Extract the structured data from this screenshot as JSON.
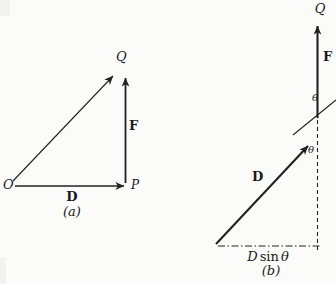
{
  "figure": {
    "ink_color": "#222222",
    "background_color": "#fbfbfa",
    "panel_a": {
      "caption": "(a)",
      "point_O": "O",
      "point_P": "P",
      "point_Q": "Q",
      "vector_D": "D",
      "vector_F": "F"
    },
    "panel_b": {
      "caption": "(b)",
      "point_Q": "Q",
      "vector_D": "D",
      "vector_F": "F",
      "angle_upper": "θ",
      "angle_lower": "θ",
      "base_label": {
        "D": "D",
        "sin": "sin",
        "theta": "θ"
      }
    }
  }
}
